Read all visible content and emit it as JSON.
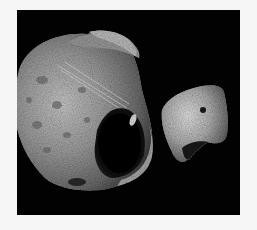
{
  "image": {
    "subject": "Phobos and Deimos, moons of Mars",
    "background_color": "#f6f6f6",
    "frame_color": "#020202",
    "objects": [
      {
        "name": "phobos",
        "description": "large cratered moon, left, with deep crater shadow on lower right and grooves across surface"
      },
      {
        "name": "deimos",
        "description": "smaller smooth irregular moon, right, with a small dark crater"
      }
    ]
  }
}
